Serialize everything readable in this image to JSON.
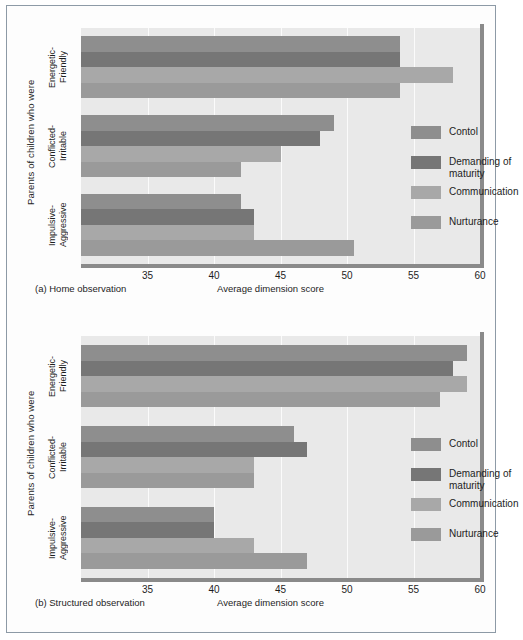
{
  "figure": {
    "series_colors": {
      "Contol": "#8e8e8e",
      "Demanding of maturity": "#767676",
      "Communication": "#a8a8a8",
      "Nurturance": "#9a9a9a"
    },
    "plot_background": "#e9e9e9",
    "grid_color": "#fbfbfb"
  },
  "legend": {
    "entries": [
      {
        "label": "Contol",
        "color": "#8e8e8e"
      },
      {
        "label": "Demanding of\nmaturity",
        "color": "#767676"
      },
      {
        "label": "Communication",
        "color": "#a8a8a8"
      },
      {
        "label": "Nurturance",
        "color": "#9a9a9a"
      }
    ]
  },
  "panel_a": {
    "caption": "(a) Home observation",
    "xlabel": "Average dimension score",
    "ylabel": "Parents of children who were",
    "categories": [
      "Energetic-\nFriendly",
      "Conflicted-\nIrritable",
      "Impulsive-\nAggressive"
    ]
  },
  "panel_b": {
    "caption": "(b) Structured observation",
    "xlabel": "Average dimension score",
    "ylabel": "Parents of children who were",
    "categories": [
      "Energetic-\nFriendly",
      "Conflicted-\nIrritable",
      "Impulsive-\nAggressive"
    ]
  },
  "chart_data": [
    {
      "type": "bar",
      "orientation": "horizontal",
      "title": "(a) Home observation",
      "xlabel": "Average dimension score",
      "ylabel": "Parents of children who were",
      "categories": [
        "Energetic-Friendly",
        "Conflicted-Irritable",
        "Impulsive-Aggressive"
      ],
      "series": [
        {
          "name": "Contol",
          "values": [
            54,
            49,
            42
          ]
        },
        {
          "name": "Demanding of maturity",
          "values": [
            54,
            48,
            43
          ]
        },
        {
          "name": "Communication",
          "values": [
            58,
            45,
            43
          ]
        },
        {
          "name": "Nurturance",
          "values": [
            54,
            42,
            50.5
          ]
        }
      ],
      "xlim": [
        30,
        60
      ],
      "xticks": [
        35,
        40,
        45,
        50,
        55,
        60
      ],
      "grid": true,
      "legend_position": "inside-right"
    },
    {
      "type": "bar",
      "orientation": "horizontal",
      "title": "(b) Structured observation",
      "xlabel": "Average dimension score",
      "ylabel": "Parents of children who were",
      "categories": [
        "Energetic-Friendly",
        "Conflicted-Irritable",
        "Impulsive-Aggressive"
      ],
      "series": [
        {
          "name": "Contol",
          "values": [
            59,
            46,
            40
          ]
        },
        {
          "name": "Demanding of maturity",
          "values": [
            58,
            47,
            40
          ]
        },
        {
          "name": "Communication",
          "values": [
            59,
            43,
            43
          ]
        },
        {
          "name": "Nurturance",
          "values": [
            57,
            43,
            47
          ]
        }
      ],
      "xlim": [
        30,
        60
      ],
      "xticks": [
        35,
        40,
        45,
        50,
        55,
        60
      ],
      "grid": true,
      "legend_position": "inside-right"
    }
  ]
}
